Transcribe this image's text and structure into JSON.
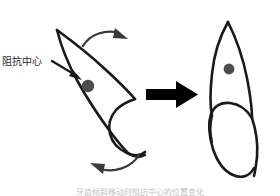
{
  "figure": {
    "title": "",
    "background_color": "#ffffff",
    "stroke_color": "#1a1a1a",
    "dot_color": "#4d4d4d",
    "arrow_color": "#333333",
    "transform_arrow_color": "#000000",
    "caption": "牙齿倾斜移动时阻抗中心的位置变化"
  },
  "annotations": {
    "center_of_resistance_label": "阻抗中心"
  },
  "diagram_data": {
    "type": "diagram",
    "left_panel": {
      "name": "tilted-tooth",
      "description": "tooth tilted with root up-left and crown down-right",
      "center_of_resistance_point": [
        88,
        86
      ],
      "rotation_arrows": [
        "clockwise-top",
        "counterclockwise-bottom"
      ]
    },
    "right_panel": {
      "name": "upright-tooth",
      "description": "tooth in upright vertical position",
      "center_of_resistance_point": [
        229,
        69
      ]
    },
    "transform_arrow": {
      "from": [
        146,
        94
      ],
      "to": [
        196,
        94
      ],
      "direction": "right"
    }
  }
}
